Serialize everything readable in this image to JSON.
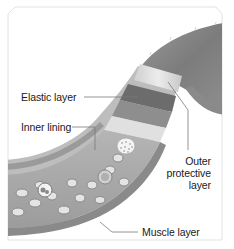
{
  "diagram": {
    "labels": {
      "elastic_layer": "Elastic layer",
      "inner_lining": "Inner lining",
      "outer_protective_line1": "Outer",
      "outer_protective_line2": "protective",
      "outer_protective_line3": "layer",
      "muscle_layer": "Muscle layer"
    },
    "colors": {
      "border": "#e2e2e2",
      "vessel_outer": "#8a8a8a",
      "vessel_dark": "#6e6e6e",
      "vessel_light": "#d8d8d8",
      "leader_line": "#7a7a7a",
      "label_text": "#1a1a1a"
    }
  }
}
